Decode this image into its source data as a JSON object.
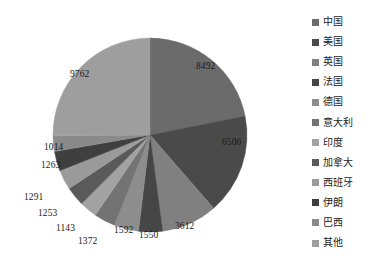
{
  "chart_data": {
    "type": "pie",
    "title": "",
    "categories": [
      "中国",
      "美国",
      "英国",
      "法国",
      "德国",
      "意大利",
      "印度",
      "加拿大",
      "西班牙",
      "伊朗",
      "巴西",
      "其他"
    ],
    "values": [
      8492,
      6506,
      3612,
      1550,
      1592,
      1372,
      1143,
      1253,
      1291,
      1263,
      1014,
      9762
    ],
    "colors": [
      "#6b6b6b",
      "#4a4a4a",
      "#808080",
      "#464646",
      "#8d8d8d",
      "#737373",
      "#a2a2a2",
      "#5a5a5a",
      "#9a9a9a",
      "#3f3f3f",
      "#8a8a8a",
      "#9e9e9e"
    ],
    "start_angle_deg": 0,
    "direction": "clockwise",
    "legend_position": "right",
    "grid": false,
    "labels_shown": [
      "8492",
      "6506",
      "3612",
      "1550",
      "1592",
      "1372",
      "1143",
      "1253",
      "1291",
      "1263",
      "1014",
      "9762"
    ]
  },
  "slice_labels": [
    {
      "text": "8492",
      "x": 196,
      "y": 62
    },
    {
      "text": "6506",
      "x": 222,
      "y": 138
    },
    {
      "text": "3612",
      "x": 175,
      "y": 222
    },
    {
      "text": "1550",
      "x": 139,
      "y": 231
    },
    {
      "text": "1592",
      "x": 114,
      "y": 226
    },
    {
      "text": "1372",
      "x": 78,
      "y": 237
    },
    {
      "text": "1143",
      "x": 56,
      "y": 224
    },
    {
      "text": "1253",
      "x": 38,
      "y": 209
    },
    {
      "text": "1291",
      "x": 24,
      "y": 193
    },
    {
      "text": "1263",
      "x": 41,
      "y": 161
    },
    {
      "text": "1014",
      "x": 44,
      "y": 143
    },
    {
      "text": "9762",
      "x": 70,
      "y": 70
    }
  ],
  "legend": {
    "items": [
      {
        "label": "中国",
        "color": "#6b6b6b"
      },
      {
        "label": "美国",
        "color": "#4a4a4a"
      },
      {
        "label": "英国",
        "color": "#808080"
      },
      {
        "label": "法国",
        "color": "#464646"
      },
      {
        "label": "德国",
        "color": "#8d8d8d"
      },
      {
        "label": "意大利",
        "color": "#737373"
      },
      {
        "label": "印度",
        "color": "#a2a2a2"
      },
      {
        "label": "加拿大",
        "color": "#5a5a5a"
      },
      {
        "label": "西班牙",
        "color": "#9a9a9a"
      },
      {
        "label": "伊朗",
        "color": "#3f3f3f"
      },
      {
        "label": "巴西",
        "color": "#8a8a8a"
      },
      {
        "label": "其他",
        "color": "#9e9e9e"
      }
    ]
  }
}
